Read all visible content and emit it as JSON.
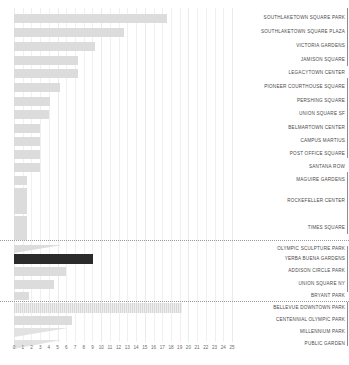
{
  "chart_data": {
    "type": "bar",
    "orientation": "horizontal",
    "title": "",
    "xlabel": "",
    "ylabel": "",
    "xlim": [
      0,
      25
    ],
    "grid": true,
    "legend": "none",
    "label_position": "right",
    "xticks": [
      "0",
      "1",
      "2",
      "3",
      "4",
      "5",
      "6",
      "7",
      "8",
      "9",
      "10",
      "11",
      "12",
      "13",
      "14",
      "15",
      "16",
      "17",
      "18",
      "19",
      "20",
      "21",
      "22",
      "23",
      "24",
      "25"
    ],
    "highlight_color": "#2b2b2b",
    "bar_color": "#dcdcdc",
    "categories": [
      "SOUTHLAKETOWN SQUARE PARK",
      "SOUTHLAKETOWN SQUARE PLAZA",
      "VICTORIA GARDENS",
      "JAMISON SQUARE",
      "LEGACYTOWN CENTER",
      "PIONEER COURTHOUSE SQUARE",
      "PERSHING SQUARE",
      "UNION SQUARE SF",
      "BELMARTOWN CENTER",
      "CAMPUS MARTIUS",
      "POST OFFICE SQUARE",
      "SANTANA ROW",
      "MAGUIRE GARDENS",
      "ROCKEFELLER CENTER",
      "TIMES SQUARE",
      "OLYMPIC SCULPTURE PARK",
      "YERBA BUENA GARDENS",
      "ADDISON CIRCLE PARK",
      "UNION SQUARE NY",
      "BRYANT PARK",
      "BELLEVUE DOWNTOWN PARK",
      "CENTENNIAL OLYMPIC PARK",
      "MILLENNIUM PARK",
      "PUBLIC GARDEN"
    ],
    "values": [
      17.6,
      12.6,
      9.3,
      7.4,
      7.3,
      5.3,
      4.1,
      4.0,
      3.0,
      3.0,
      3.0,
      3.0,
      1.5,
      1.5,
      1.5,
      5.5,
      9.1,
      6.0,
      4.6,
      1.7,
      19.3,
      6.6,
      6.2,
      5.4
    ],
    "series_name": "value",
    "groups": [
      {
        "name": "group-1",
        "start": 0,
        "end": 14
      },
      {
        "name": "group-2",
        "start": 15,
        "end": 19
      },
      {
        "name": "group-3",
        "start": 20,
        "end": 23
      }
    ],
    "annotations": {
      "highlighted_category": "YERBA BUENA GARDENS",
      "separators_after": [
        "TIMES SQUARE",
        "BRYANT PARK"
      ]
    }
  },
  "rows": [
    {
      "label": "SOUTHLAKETOWN SQUARE PARK",
      "value": 17.6,
      "y": 14,
      "h": 9,
      "w": 153,
      "style": "bar"
    },
    {
      "label": "SOUTHLAKETOWN SQUARE PLAZA",
      "value": 12.6,
      "y": 28,
      "h": 9,
      "w": 110,
      "style": "bar"
    },
    {
      "label": "VICTORIA GARDENS",
      "value": 9.3,
      "y": 42,
      "h": 9,
      "w": 81,
      "style": "bar"
    },
    {
      "label": "JAMISON SQUARE",
      "value": 7.4,
      "y": 56,
      "h": 9,
      "w": 64,
      "style": "bar"
    },
    {
      "label": "LEGACYTOWN CENTER",
      "value": 7.3,
      "y": 69,
      "h": 9,
      "w": 64,
      "style": "bar"
    },
    {
      "label": "PIONEER COURTHOUSE SQUARE",
      "value": 5.3,
      "y": 83,
      "h": 9,
      "w": 46,
      "style": "bar"
    },
    {
      "label": "PERSHING SQUARE",
      "value": 4.1,
      "y": 97,
      "h": 9,
      "w": 36,
      "style": "bar"
    },
    {
      "label": "UNION SQUARE SF",
      "value": 4.0,
      "y": 110,
      "h": 9,
      "w": 35,
      "style": "bar"
    },
    {
      "label": "BELMARTOWN CENTER",
      "value": 3.0,
      "y": 124,
      "h": 9,
      "w": 26,
      "style": "bar"
    },
    {
      "label": "CAMPUS MARTIUS",
      "value": 3.0,
      "y": 137,
      "h": 9,
      "w": 26,
      "style": "bar"
    },
    {
      "label": "POST OFFICE SQUARE",
      "value": 3.0,
      "y": 150,
      "h": 9,
      "w": 26,
      "style": "bar"
    },
    {
      "label": "SANTANA ROW",
      "value": 3.0,
      "y": 163,
      "h": 9,
      "w": 26,
      "style": "bar"
    },
    {
      "label": "MAGUIRE GARDENS",
      "value": 1.5,
      "y": 176,
      "h": 9,
      "w": 13,
      "style": "bar"
    },
    {
      "label": "ROCKEFELLER CENTER",
      "value": 1.5,
      "y": 188,
      "h": 26,
      "w": 13,
      "style": "bar"
    },
    {
      "label": "TIMES SQUARE",
      "value": 1.5,
      "y": 216,
      "h": 24,
      "w": 13,
      "style": "bar"
    },
    {
      "label": "OLYMPIC SCULPTURE PARK",
      "value": 5.5,
      "y": 245,
      "h": 8,
      "w": 48,
      "style": "wedge"
    },
    {
      "label": "YERBA BUENA GARDENS",
      "value": 9.1,
      "y": 254,
      "h": 10,
      "w": 79,
      "style": "highlight"
    },
    {
      "label": "ADDISON CIRCLE PARK",
      "value": 6.0,
      "y": 267,
      "h": 9,
      "w": 52,
      "style": "bar"
    },
    {
      "label": "UNION SQUARE NY",
      "value": 4.6,
      "y": 280,
      "h": 9,
      "w": 40,
      "style": "bar"
    },
    {
      "label": "BRYANT PARK",
      "value": 1.7,
      "y": 292,
      "h": 8,
      "w": 15,
      "style": "bar"
    },
    {
      "label": "BELLEVUE DOWNTOWN PARK",
      "value": 19.3,
      "y": 303,
      "h": 10,
      "w": 168,
      "style": "hatch"
    },
    {
      "label": "CENTENNIAL OLYMPIC PARK",
      "value": 6.6,
      "y": 316,
      "h": 9,
      "w": 58,
      "style": "bar"
    },
    {
      "label": "MILLENNIUM PARK",
      "value": 6.2,
      "y": 328,
      "h": 9,
      "w": 54,
      "style": "wedge-soft"
    },
    {
      "label": "PUBLIC GARDEN",
      "value": 5.4,
      "y": 340,
      "h": 9,
      "w": 47,
      "style": "wedge-soft"
    }
  ],
  "separators": [
    {
      "name": "separator-after-times-square",
      "y": 240
    },
    {
      "name": "separator-after-bryant-park",
      "y": 301
    }
  ],
  "edge_marks": [
    {
      "y": 8,
      "h": 58
    },
    {
      "y": 78,
      "h": 80
    },
    {
      "y": 172,
      "h": 62
    },
    {
      "y": 246,
      "h": 46
    },
    {
      "y": 302,
      "h": 44
    }
  ]
}
